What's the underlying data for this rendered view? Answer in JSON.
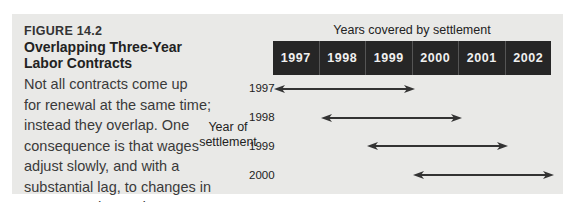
{
  "figure": {
    "label": "FIGURE 14.2",
    "title_lines": [
      "Overlapping Three-Year",
      "Labor Contracts"
    ],
    "body_lines": [
      "Not all contracts come up",
      "for renewal at the same time;",
      "instead they overlap. One",
      "consequence is that wages",
      "adjust slowly, and with a",
      "substantial lag, to changes in",
      "aggregate demand."
    ]
  },
  "diagram": {
    "x_axis_label": "Years covered by settlement",
    "y_axis_label_lines": [
      "Year of",
      "settlement"
    ],
    "covered_years": [
      "1997",
      "1998",
      "1999",
      "2000",
      "2001",
      "2002"
    ],
    "settlements": [
      {
        "year": "1997",
        "covers_from": "1997",
        "covers_to": "1999"
      },
      {
        "year": "1998",
        "covers_from": "1998",
        "covers_to": "2000"
      },
      {
        "year": "1999",
        "covers_from": "1999",
        "covers_to": "2001"
      },
      {
        "year": "2000",
        "covers_from": "2000",
        "covers_to": "2002"
      }
    ],
    "colors": {
      "panel_bg": "#e9e9e7",
      "year_band_bg": "#262626",
      "year_text": "#f0f0f0",
      "arrow": "#333333"
    }
  }
}
